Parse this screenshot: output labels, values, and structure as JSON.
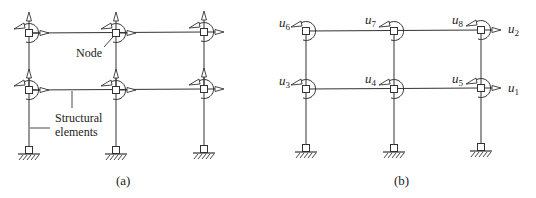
{
  "figure": {
    "panel_a": {
      "caption": "(a)",
      "labels": {
        "node": "Node",
        "structural_line1": "Structural",
        "structural_line2": "elements"
      }
    },
    "panel_b": {
      "caption": "(b)",
      "dof_labels": [
        {
          "id": "u6",
          "base": "u",
          "sub": "6"
        },
        {
          "id": "u7",
          "base": "u",
          "sub": "7"
        },
        {
          "id": "u8",
          "base": "u",
          "sub": "8"
        },
        {
          "id": "u2",
          "base": "u",
          "sub": "2"
        },
        {
          "id": "u3",
          "base": "u",
          "sub": "3"
        },
        {
          "id": "u4",
          "base": "u",
          "sub": "4"
        },
        {
          "id": "u5",
          "base": "u",
          "sub": "5"
        },
        {
          "id": "u1",
          "base": "u",
          "sub": "1"
        }
      ]
    },
    "colors": {
      "line": "#333333",
      "background": "#ffffff"
    }
  }
}
